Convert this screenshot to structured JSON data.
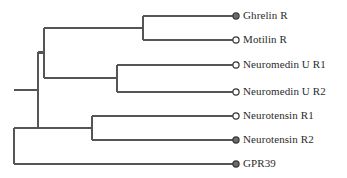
{
  "figure": {
    "type": "phylogenetic-tree",
    "title": "",
    "background_color": "#ffffff",
    "line_color": "#555555",
    "text_color": "#2b2b2b",
    "marker_filled_color": "#6b6b6b",
    "marker_open_color": "#ffffff",
    "marker_edge_color": "#3a3a3a"
  },
  "chart_data": {
    "type": "tree",
    "title": "",
    "xlabel": "",
    "ylabel": "",
    "leaves": [
      {
        "label": "Ghrelin R",
        "marker": "filled",
        "row": 0,
        "y": 16,
        "tip_x": 236
      },
      {
        "label": "Motilin R",
        "marker": "open",
        "row": 1,
        "y": 40,
        "tip_x": 236
      },
      {
        "label": "Neuromedin U R1",
        "marker": "open",
        "row": 2,
        "y": 65,
        "tip_x": 236
      },
      {
        "label": "Neuromedin U R2",
        "marker": "open",
        "row": 3,
        "y": 92,
        "tip_x": 236
      },
      {
        "label": "Neurotensin R1",
        "marker": "open",
        "row": 4,
        "y": 116,
        "tip_x": 236
      },
      {
        "label": "Neurotensin R2",
        "marker": "filled",
        "row": 5,
        "y": 140,
        "tip_x": 236
      },
      {
        "label": "GPR39",
        "marker": "filled",
        "row": 6,
        "y": 164,
        "tip_x": 236
      }
    ],
    "internal_nodes": [
      {
        "name": "ghrelin-motilin-clade",
        "x": 143,
        "y_top": 16,
        "y_bottom": 40,
        "parent_x": 44
      },
      {
        "name": "neuromedin-clade",
        "x": 117,
        "y_top": 65,
        "y_bottom": 92,
        "parent_x": 44
      },
      {
        "name": "neurotensin-clade",
        "x": 92,
        "y_top": 116,
        "y_bottom": 140,
        "parent_x": 38
      },
      {
        "name": "upper-superclade",
        "x": 44,
        "y_top": 28,
        "y_bottom": 78,
        "parent_x": 38
      },
      {
        "name": "non-gpr39-clade",
        "x": 38,
        "y_top": 52,
        "y_bottom": 128,
        "parent_x": 14
      },
      {
        "name": "root",
        "x": 14,
        "y_top": 128,
        "y_bottom": 164,
        "parent_x": 14
      }
    ]
  }
}
